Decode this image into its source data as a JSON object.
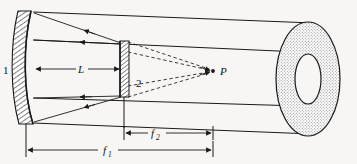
{
  "figure": {
    "background_color": "#f7f6f4",
    "line_color": "#1a1a1a"
  },
  "labels": {
    "mirror1": "1",
    "mirror2": "2",
    "point_p": "P",
    "separation_L": "L",
    "focal_f1_base": "f",
    "focal_f1_sub": "1",
    "focal_f2_base": "f",
    "focal_f2_sub": "2"
  },
  "elements": {
    "mirror1_name": "concave-mirror-1",
    "mirror2_name": "flat-mirror-2",
    "tube_name": "cylindrical-tube",
    "annulus_name": "annular-aperture",
    "focus_point_name": "focal-point-p",
    "solid_rays_name": "solid-ray-bundle",
    "dashed_rays_name": "dashed-ray-bundle",
    "dim_L_name": "dimension-L",
    "dim_f1_name": "dimension-f1",
    "dim_f2_name": "dimension-f2"
  },
  "geometry": {
    "mirror1_x_front": 31,
    "mirror1_x_back": 18,
    "mirror1_top_y": 11,
    "mirror1_bottom_y": 124,
    "mirror2_x_left": 120,
    "mirror2_x_right": 129,
    "mirror2_top_y": 41,
    "mirror2_bottom_y": 97,
    "point_p_x": 213,
    "point_p_y": 71,
    "annulus_cx": 308,
    "annulus_cy": 79,
    "annulus_outer_rx": 32,
    "annulus_outer_ry": 57,
    "annulus_inner_rx": 13,
    "annulus_inner_ry": 25,
    "dim_L_y": 69,
    "dim_f2_y": 133,
    "dim_f1_y": 150
  }
}
